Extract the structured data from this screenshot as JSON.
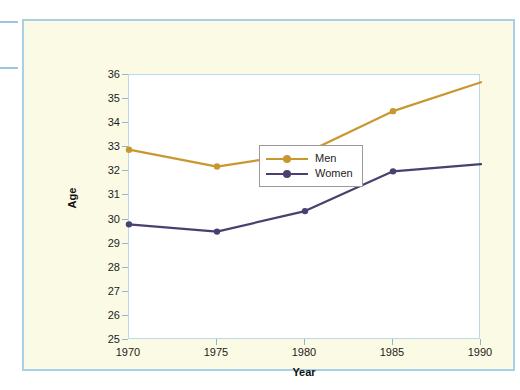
{
  "chart_data": {
    "type": "line",
    "title": "",
    "xlabel": "Year",
    "ylabel": "Age",
    "x": [
      1970,
      1975,
      1980,
      1985,
      1990
    ],
    "categories": [
      "1970",
      "1975",
      "1980",
      "1985",
      "1990"
    ],
    "xticklabels": [
      "1970",
      "1975",
      "1980",
      "1985",
      "1990"
    ],
    "yticklabels": [
      "36",
      "35",
      "34",
      "33",
      "32",
      "31",
      "30",
      "29",
      "28",
      "27",
      "26",
      "25"
    ],
    "xlim": [
      1970,
      1990
    ],
    "ylim": [
      25,
      36
    ],
    "grid": false,
    "legend_position": "upper-left-inside",
    "series": [
      {
        "name": "Men",
        "color": "#c8982f",
        "marker": "circle",
        "values": [
          32.9,
          32.2,
          32.75,
          34.5,
          35.7
        ]
      },
      {
        "name": "Women",
        "color": "#4a3f6e",
        "marker": "circle",
        "values": [
          29.8,
          29.5,
          30.35,
          32.0,
          32.3
        ]
      }
    ]
  },
  "legend": {
    "entries": [
      {
        "label": "Men"
      },
      {
        "label": "Women"
      }
    ]
  },
  "axes": {
    "x_title": "Year",
    "y_title": "Age"
  },
  "colors": {
    "men_line": "#c8982f",
    "women_line": "#4a3f6e",
    "figure_background": "#fbfae4",
    "figure_border": "#a8cfe3",
    "plot_background": "#ffffff",
    "plot_border": "#bcd9e8",
    "legend_border": "#9a9a9a",
    "tick_color": "#8fb8cf",
    "text_color": "#1c1c1c"
  }
}
